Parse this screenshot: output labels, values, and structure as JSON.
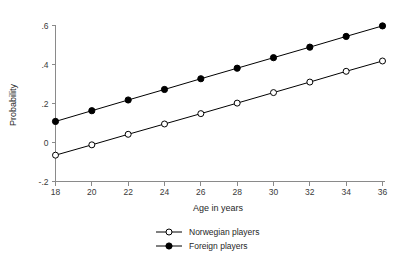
{
  "chart_data": {
    "type": "line",
    "title": "",
    "xlabel": "Age in years",
    "ylabel": "Probability",
    "x": [
      18,
      20,
      22,
      24,
      26,
      28,
      30,
      32,
      34,
      36
    ],
    "xticklabels": [
      "18",
      "20",
      "22",
      "24",
      "26",
      "28",
      "30",
      "32",
      "34",
      "36"
    ],
    "yticks": [
      -0.2,
      0,
      0.2,
      0.4,
      0.6
    ],
    "yticklabels": [
      "-.2",
      "0",
      ".2",
      ".4",
      ".6"
    ],
    "xlim": [
      18,
      36
    ],
    "ylim": [
      -0.2,
      0.6
    ],
    "grid": false,
    "legend_position": "below",
    "series": [
      {
        "name": "Norwegian players",
        "marker": "open-circle",
        "color": "#000000",
        "values": [
          -0.065,
          -0.012,
          0.042,
          0.095,
          0.148,
          0.202,
          0.256,
          0.31,
          0.365,
          0.418
        ]
      },
      {
        "name": "Foreign players",
        "marker": "filled-circle",
        "color": "#000000",
        "values": [
          0.108,
          0.163,
          0.218,
          0.272,
          0.327,
          0.381,
          0.435,
          0.489,
          0.544,
          0.598
        ]
      }
    ]
  },
  "legend": {
    "items": [
      {
        "label": "Norwegian players",
        "marker": "open-circle"
      },
      {
        "label": "Foreign players",
        "marker": "filled-circle"
      }
    ]
  }
}
